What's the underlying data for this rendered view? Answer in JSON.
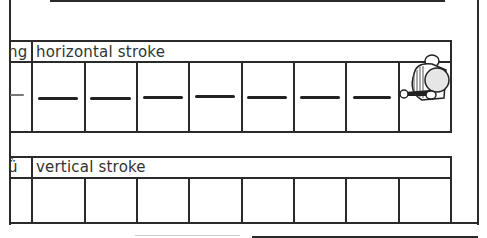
{
  "worksheet": {
    "rows": [
      {
        "prefix_fragment": "ng",
        "label": "horizontal stroke",
        "cells": 8,
        "traced_strokes": 7,
        "left_partial_stroke": "—"
      },
      {
        "prefix_fragment": "ǜ",
        "label": "vertical stroke",
        "cells": 8,
        "traced_strokes": 0
      }
    ],
    "illustration": "cartoon-character-holding-pencil",
    "colors": {
      "line": "#2a2a2a",
      "text": "#333333",
      "background": "#ffffff"
    }
  }
}
